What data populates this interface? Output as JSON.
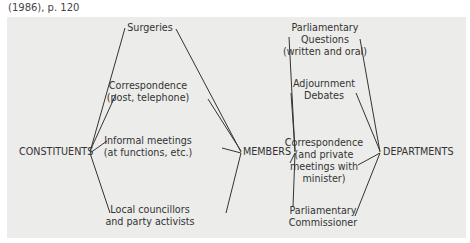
{
  "caption": "(1986), p. 120",
  "nodes": {
    "constituents": "CONSTITUENTS",
    "members": "MEMBERS",
    "departments": "DEPARTMENTS"
  },
  "left_channels": [
    {
      "line1": "Surgeries",
      "line2": ""
    },
    {
      "line1": "Correspondence",
      "line2": "(post, telephone)"
    },
    {
      "line1": "Informal meetings",
      "line2": "(at functions, etc.)"
    },
    {
      "line1": "Local councillors",
      "line2": "and party activists"
    }
  ],
  "right_channels": [
    {
      "line1": "Parliamentary",
      "line2": "Questions",
      "line3": "(written and oral)"
    },
    {
      "line1": "Adjournment",
      "line2": "Debates"
    },
    {
      "line1": "Correspondence",
      "line2": "(and private",
      "line3": "meetings with",
      "line4": "minister)"
    },
    {
      "line1": "Parliamentary",
      "line2": "Commissioner"
    }
  ],
  "colors": {
    "panel": "#ececea",
    "line": "#333333"
  }
}
